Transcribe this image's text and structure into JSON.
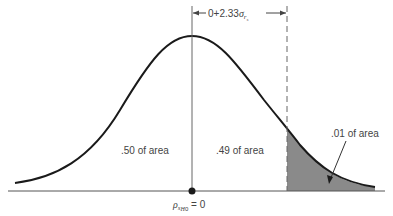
{
  "diagram": {
    "type": "normal_distribution_one_tailed",
    "top_bracket_label": {
      "prefix": "0+2.33",
      "sigma": "σ",
      "subscript": "r",
      "subsubscript": "s"
    },
    "regions": [
      {
        "label": ".50 of area",
        "side": "left"
      },
      {
        "label": ".49 of area",
        "side": "center-right"
      },
      {
        "label": ".01 of area",
        "side": "tail",
        "shaded": true
      }
    ],
    "center_label": {
      "rho": "ρ",
      "sub": "s",
      "subsub": "H",
      "subsubsub": "0",
      "rest": " = 0"
    },
    "colors": {
      "curve": "#1a1a1a",
      "shade": "#8a8a8a",
      "guide": "#555555",
      "text": "#444444"
    }
  }
}
